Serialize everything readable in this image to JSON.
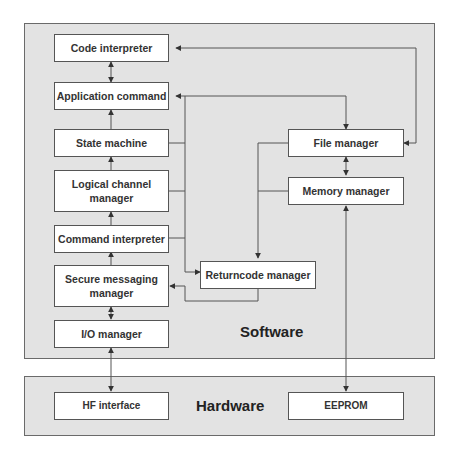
{
  "diagram": {
    "software_panel": {
      "label": "Software"
    },
    "hardware_panel": {
      "label": "Hardware"
    },
    "nodes": {
      "code_interpreter": "Code interpreter",
      "application_command": "Application command",
      "state_machine": "State machine",
      "logical_channel_manager_line1": "Logical channel",
      "logical_channel_manager_line2": "manager",
      "command_interpreter": "Command interpreter",
      "secure_messaging_manager_line1": "Secure messaging",
      "secure_messaging_manager_line2": "manager",
      "io_manager": "I/O manager",
      "file_manager": "File manager",
      "memory_manager": "Memory manager",
      "returncode_manager": "Returncode manager",
      "hf_interface": "HF interface",
      "eeprom": "EEPROM"
    },
    "edges": [
      {
        "from": "Application command",
        "to": "Code interpreter",
        "type": "bidirectional"
      },
      {
        "from": "State machine",
        "to": "Application command",
        "type": "arrow"
      },
      {
        "from": "Logical channel manager",
        "to": "State machine",
        "type": "arrow"
      },
      {
        "from": "Command interpreter",
        "to": "Logical channel manager",
        "type": "arrow"
      },
      {
        "from": "Secure messaging manager",
        "to": "Command interpreter",
        "type": "arrow"
      },
      {
        "from": "I/O manager",
        "to": "Secure messaging manager",
        "type": "bidirectional"
      },
      {
        "from": "HF interface",
        "to": "I/O manager",
        "type": "bidirectional"
      },
      {
        "from": "File manager",
        "to": "Code interpreter",
        "type": "bidirectional"
      },
      {
        "from": "Application command",
        "to": "File manager",
        "type": "bidirectional"
      },
      {
        "from": "File manager",
        "to": "Memory manager",
        "type": "bidirectional"
      },
      {
        "from": "Memory manager",
        "to": "EEPROM",
        "type": "bidirectional"
      },
      {
        "from": "Application command bus",
        "to": "Returncode manager",
        "type": "arrow"
      },
      {
        "from": "File/Memory manager bus",
        "to": "Returncode manager",
        "type": "arrow"
      },
      {
        "from": "Returncode manager",
        "to": "Secure messaging manager",
        "type": "arrow"
      }
    ]
  }
}
